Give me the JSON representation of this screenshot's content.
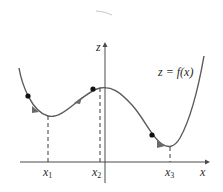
{
  "diagram": {
    "title": "",
    "curve_label": "z = f(x)",
    "axes": {
      "x_label": "x",
      "z_label": "z"
    },
    "points": [
      {
        "name": "x",
        "sub": "1"
      },
      {
        "name": "x",
        "sub": "2"
      },
      {
        "name": "x",
        "sub": "3"
      }
    ],
    "colors": {
      "curve": "#5a5a5a",
      "axis": "#4a4a4a",
      "dot": "#111111",
      "arrow": "#6a6a6a",
      "dash": "#3a3a3a"
    }
  }
}
